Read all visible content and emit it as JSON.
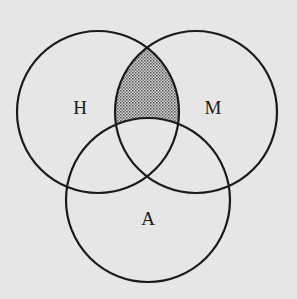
{
  "diagram": {
    "type": "venn",
    "sets": [
      {
        "id": "H",
        "label": "H",
        "cx": 98,
        "cy": 112,
        "r": 81,
        "label_x": 80,
        "label_y": 114
      },
      {
        "id": "M",
        "label": "M",
        "cx": 196,
        "cy": 112,
        "r": 81,
        "label_x": 213,
        "label_y": 114
      },
      {
        "id": "A",
        "label": "A",
        "cx": 148,
        "cy": 200,
        "r": 82,
        "label_x": 148,
        "label_y": 225
      }
    ],
    "shaded_region": "H ∩ M − A",
    "colors": {
      "background": "#e6e6e6",
      "stroke": "#1a1a1a",
      "shade_dot": "#555555"
    }
  }
}
